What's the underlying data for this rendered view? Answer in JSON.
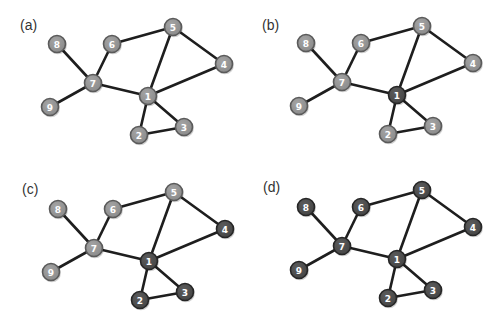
{
  "figure": {
    "colors": {
      "gray_fill": "#8c8c8c",
      "gray_stroke": "#5a5a5a",
      "dark_fill": "#464646",
      "dark_stroke": "#262626",
      "edge": "#1e1e1e",
      "background": "#ffffff"
    },
    "nodes": [
      {
        "id": "1",
        "x": 148,
        "y": 96
      },
      {
        "id": "2",
        "x": 139,
        "y": 135
      },
      {
        "id": "3",
        "x": 184,
        "y": 127
      },
      {
        "id": "4",
        "x": 224,
        "y": 64
      },
      {
        "id": "5",
        "x": 173,
        "y": 27
      },
      {
        "id": "6",
        "x": 112,
        "y": 44
      },
      {
        "id": "7",
        "x": 93,
        "y": 83
      },
      {
        "id": "8",
        "x": 57,
        "y": 44
      },
      {
        "id": "9",
        "x": 50,
        "y": 107
      }
    ],
    "edges": [
      [
        "8",
        "7"
      ],
      [
        "9",
        "7"
      ],
      [
        "6",
        "7"
      ],
      [
        "6",
        "5"
      ],
      [
        "7",
        "1"
      ],
      [
        "5",
        "1"
      ],
      [
        "5",
        "4"
      ],
      [
        "4",
        "1"
      ],
      [
        "1",
        "2"
      ],
      [
        "1",
        "3"
      ],
      [
        "2",
        "3"
      ]
    ],
    "panels": [
      {
        "label": "(a)",
        "offset_x": 0,
        "offset_y": 0,
        "label_x": 20,
        "label_y": 18,
        "dark_nodes": []
      },
      {
        "label": "(b)",
        "offset_x": 249,
        "offset_y": -1,
        "label_x": 262,
        "label_y": 18,
        "dark_nodes": [
          "1"
        ]
      },
      {
        "label": "(c)",
        "offset_x": 1,
        "offset_y": 165,
        "label_x": 22,
        "label_y": 182,
        "dark_nodes": [
          "1",
          "2",
          "3",
          "4"
        ]
      },
      {
        "label": "(d)",
        "offset_x": 249,
        "offset_y": 163,
        "label_x": 263,
        "label_y": 180,
        "dark_nodes": [
          "1",
          "2",
          "3",
          "4",
          "5",
          "6",
          "7",
          "8",
          "9"
        ]
      }
    ]
  }
}
